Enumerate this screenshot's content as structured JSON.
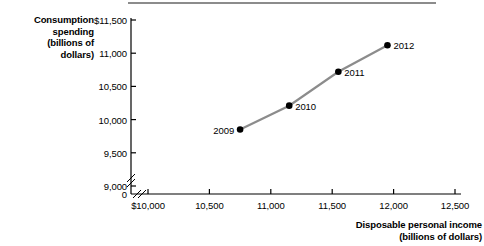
{
  "chart_data": {
    "type": "line",
    "title": "",
    "subtitle": "",
    "xlabel": "Disposable personal income (billions of dollars)",
    "ylabel": "Consumption spending (billions of dollars)",
    "xlim": [
      10000,
      12500
    ],
    "ylim": [
      9000,
      11500
    ],
    "grid": false,
    "legend": "none",
    "axis_break_x": true,
    "axis_break_y": true,
    "x_tick_labels": [
      "$10,000",
      "10,500",
      "11,000",
      "11,500",
      "12,000",
      "12,500"
    ],
    "x_tick_values": [
      10000,
      10500,
      11000,
      11500,
      12000,
      12500
    ],
    "y_tick_labels": [
      "$11,500",
      "11,000",
      "10,500",
      "10,000",
      "9,500",
      "9,000",
      "0"
    ],
    "y_tick_values": [
      11500,
      11000,
      10500,
      10000,
      9500,
      9000,
      0
    ],
    "series": [
      {
        "name": "Consumption vs. disposable income",
        "line_color": "#8c8c8c",
        "marker_color": "#000000",
        "points": [
          {
            "label": "2009",
            "x": 10750,
            "y": 9850,
            "label_side": "left"
          },
          {
            "label": "2010",
            "x": 11150,
            "y": 10210,
            "label_side": "right"
          },
          {
            "label": "2011",
            "x": 11550,
            "y": 10720,
            "label_side": "right"
          },
          {
            "label": "2012",
            "x": 11950,
            "y": 11120,
            "label_side": "right"
          }
        ]
      }
    ]
  },
  "axis_titles": {
    "y_lines": [
      "Consumption",
      "spending",
      "(billions of",
      "dollars)"
    ],
    "x_lines": [
      "Disposable personal income",
      "(billions of dollars)"
    ]
  },
  "colors": {
    "line": "#8c8c8c",
    "marker": "#000000",
    "axis": "#000000",
    "rule": "#8c8c8c"
  }
}
